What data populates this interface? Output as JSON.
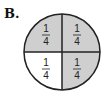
{
  "label": "B.",
  "figure": {
    "type": "fraction-circle",
    "parts": 4,
    "shaded_parts": 3,
    "colors": {
      "shaded": "#cfcfcf",
      "unshaded": "#ffffff",
      "stroke": "#222222"
    },
    "quadrants": [
      {
        "position": "top-left",
        "numerator": "1",
        "denominator": "4",
        "shaded": true
      },
      {
        "position": "top-right",
        "numerator": "1",
        "denominator": "4",
        "shaded": true
      },
      {
        "position": "bottom-left",
        "numerator": "1",
        "denominator": "4",
        "shaded": false
      },
      {
        "position": "bottom-right",
        "numerator": "1",
        "denominator": "4",
        "shaded": true
      }
    ]
  }
}
